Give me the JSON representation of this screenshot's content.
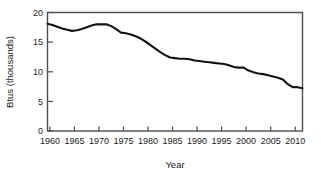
{
  "chart_data": {
    "type": "line",
    "title": "",
    "xlabel": "Year",
    "ylabel": "Btus (thousands)",
    "xlim": [
      1960,
      2012
    ],
    "ylim": [
      0,
      20
    ],
    "grid": false,
    "legend": null,
    "line_color": "#121212",
    "x_ticks": [
      1960,
      1965,
      1970,
      1975,
      1980,
      1985,
      1990,
      1995,
      2000,
      2005,
      2010
    ],
    "x_tick_labels": [
      "1960",
      "1965",
      "1970",
      "1975",
      "1980",
      "1985",
      "1990",
      "1995",
      "2000",
      "2005",
      "2010"
    ],
    "y_ticks": [
      0,
      5,
      10,
      15,
      20
    ],
    "y_tick_labels": [
      "0",
      "5",
      "10",
      "15",
      "20"
    ],
    "series": [
      {
        "name": "Btus (thousands)",
        "x": [
          1960,
          1961,
          1962,
          1963,
          1964,
          1965,
          1966,
          1967,
          1968,
          1969,
          1970,
          1971,
          1972,
          1973,
          1974,
          1975,
          1976,
          1977,
          1978,
          1979,
          1980,
          1981,
          1982,
          1983,
          1984,
          1985,
          1986,
          1987,
          1988,
          1989,
          1990,
          1991,
          1992,
          1993,
          1994,
          1995,
          1996,
          1997,
          1998,
          1999,
          2000,
          2001,
          2002,
          2003,
          2004,
          2005,
          2006,
          2007,
          2008,
          2009,
          2010,
          2011,
          2012
        ],
        "values": [
          18.1,
          17.9,
          17.6,
          17.3,
          17.1,
          16.9,
          17.0,
          17.2,
          17.5,
          17.8,
          18.0,
          18.0,
          18.0,
          17.7,
          17.2,
          16.6,
          16.5,
          16.3,
          16.0,
          15.6,
          15.1,
          14.5,
          13.9,
          13.3,
          12.8,
          12.4,
          12.3,
          12.2,
          12.2,
          12.1,
          11.9,
          11.8,
          11.7,
          11.6,
          11.5,
          11.4,
          11.3,
          11.1,
          10.8,
          10.7,
          10.7,
          10.2,
          9.9,
          9.7,
          9.6,
          9.4,
          9.2,
          9.0,
          8.7,
          7.9,
          7.4,
          7.4,
          7.2
        ]
      }
    ]
  },
  "axes": {
    "x_axis_title": "Year",
    "y_axis_title": "Btus (thousands)"
  }
}
